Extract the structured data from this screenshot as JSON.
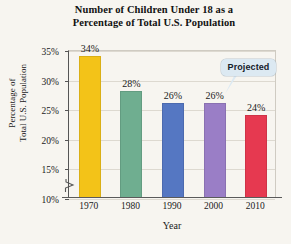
{
  "chart_data": {
    "type": "bar",
    "title": "Number of Children Under 18 as a Percentage of Total U.S. Population",
    "title_line1": "Number of Children Under 18 as a",
    "title_line2": "Percentage of Total U.S. Population",
    "xlabel": "Year",
    "ylabel": "Percentage of Total U.S. Population",
    "ylabel_line1": "Percentage of",
    "ylabel_line2": "Total U.S. Population",
    "categories": [
      "1970",
      "1980",
      "1990",
      "2000",
      "2010"
    ],
    "values": [
      34,
      28,
      26,
      26,
      24
    ],
    "value_labels": [
      "34%",
      "28%",
      "26%",
      "26%",
      "24%"
    ],
    "ylim": [
      10,
      35
    ],
    "yticks": [
      10,
      15,
      20,
      25,
      30,
      35
    ],
    "ytick_labels": [
      "10%",
      "15%",
      "20%",
      "25%",
      "30%",
      "35%"
    ],
    "axis_break": true,
    "grid": true,
    "legend": "none",
    "bar_colors": [
      "#F3C318",
      "#6FAE90",
      "#5577C2",
      "#9A7EC6",
      "#E63950"
    ],
    "annotations": [
      {
        "text": "Projected",
        "target_category": "2010",
        "style": "callout-bubble",
        "fill": "#dce9f2"
      }
    ]
  },
  "colors": {
    "background": "#f7f5f0",
    "axis": "#555555",
    "gridline": "#ddd9d0",
    "text": "#1a1a1a",
    "callout_fill": "#dce9f2"
  }
}
